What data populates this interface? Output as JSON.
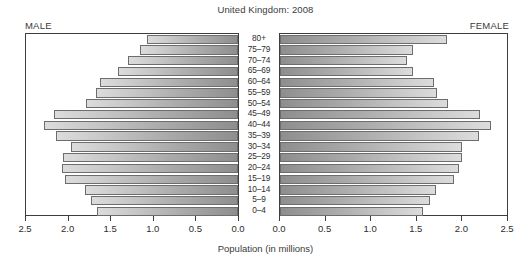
{
  "chart_data": {
    "type": "bar",
    "title": "United Kingdom: 2008",
    "subtitle": "",
    "xlabel": "Population (in millions)",
    "ylabel": "",
    "orientation": "horizontal",
    "layout": "population-pyramid",
    "grid": false,
    "legend_position": "corners",
    "left_panel_label": "MALE",
    "right_panel_label": "FEMALE",
    "categories": [
      "80+",
      "75–79",
      "70–74",
      "65–69",
      "60–64",
      "55–59",
      "50–54",
      "45–49",
      "40–44",
      "35–39",
      "30–34",
      "25–29",
      "20–24",
      "15–19",
      "10–14",
      "5–9",
      "0–4"
    ],
    "xlim": [
      0,
      2.5
    ],
    "xticks": [
      0.0,
      0.5,
      1.0,
      1.5,
      2.0,
      2.5
    ],
    "xtick_labels_left": [
      "2.5",
      "2.0",
      "1.5",
      "1.0",
      "0.5",
      "0.0"
    ],
    "xtick_labels_right": [
      "0.0",
      "0.5",
      "1.0",
      "1.5",
      "2.0",
      "2.5"
    ],
    "series": [
      {
        "name": "MALE",
        "side": "left",
        "values": [
          1.07,
          1.15,
          1.3,
          1.42,
          1.63,
          1.67,
          1.79,
          2.17,
          2.29,
          2.15,
          1.97,
          2.06,
          2.07,
          2.04,
          1.8,
          1.73,
          1.66
        ]
      },
      {
        "name": "FEMALE",
        "side": "right",
        "values": [
          1.84,
          1.46,
          1.4,
          1.46,
          1.7,
          1.73,
          1.85,
          2.2,
          2.32,
          2.19,
          2.0,
          2.0,
          1.97,
          1.92,
          1.72,
          1.65,
          1.58
        ]
      }
    ]
  },
  "colors": {
    "bar_outer": "#dcdcdc",
    "bar_inner": "#8e8e8e",
    "bar_border": "#6d6d6d",
    "axis": "#3d3d3d",
    "text": "#2d2d2d",
    "background": "#ffffff"
  }
}
